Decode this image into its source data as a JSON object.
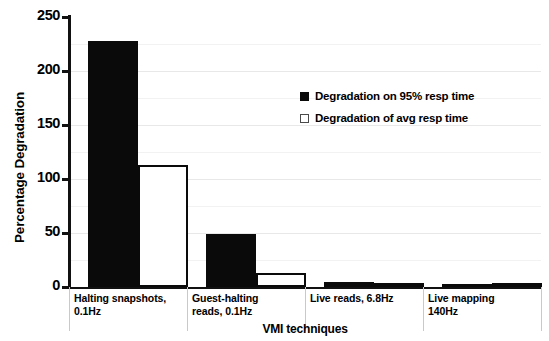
{
  "chart_data": {
    "type": "bar",
    "title": "",
    "xlabel": "VMI techniques",
    "ylabel": "Percentage Degradation",
    "ylim": [
      0,
      250
    ],
    "yticks": [
      0,
      50,
      100,
      150,
      200,
      250
    ],
    "grid": true,
    "legend_position": "inside-upper-right",
    "categories": [
      "Halting snapshots, 0.1Hz",
      "Guest-halting reads, 0.1Hz",
      "Live reads, 6.8Hz",
      "Live mapping 140Hz"
    ],
    "category_lines": [
      [
        "Halting snapshots,",
        "0.1Hz"
      ],
      [
        "Guest-halting",
        "reads, 0.1Hz"
      ],
      [
        "Live reads, 6.8Hz",
        ""
      ],
      [
        "Live mapping",
        "140Hz"
      ]
    ],
    "series": [
      {
        "name": "Degradation on 95% resp time",
        "color": "#0a0a0a",
        "style": "filled",
        "values": [
          228,
          49,
          5,
          2
        ]
      },
      {
        "name": "Degradation of avg resp time",
        "color": "#ffffff",
        "style": "outlined",
        "values": [
          113,
          13,
          3,
          1
        ]
      }
    ]
  },
  "axes": {
    "y_tick_labels": [
      "250",
      "200",
      "150",
      "100",
      "50",
      "0"
    ],
    "y_axis_title": "Percentage Degradation",
    "x_axis_title": "VMI techniques"
  },
  "legend": {
    "items": [
      {
        "label": "Degradation on 95% resp time",
        "swatch": "filled-square-icon"
      },
      {
        "label": "Degradation of avg resp time",
        "swatch": "outlined-square-icon"
      }
    ]
  }
}
